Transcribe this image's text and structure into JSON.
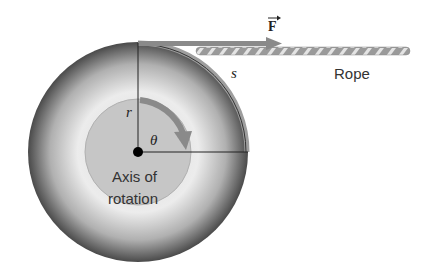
{
  "diagram": {
    "labels": {
      "force": "F",
      "arc": "s",
      "radius": "r",
      "angle": "θ",
      "rope": "Rope",
      "axis_line1": "Axis of",
      "axis_line2": "rotation"
    },
    "colors": {
      "disc_dark": "#4a4a4a",
      "disc_light": "#e6e6e6",
      "hub": "#c4c4c4",
      "arrow": "#8a8a8a",
      "line": "#222222"
    }
  }
}
